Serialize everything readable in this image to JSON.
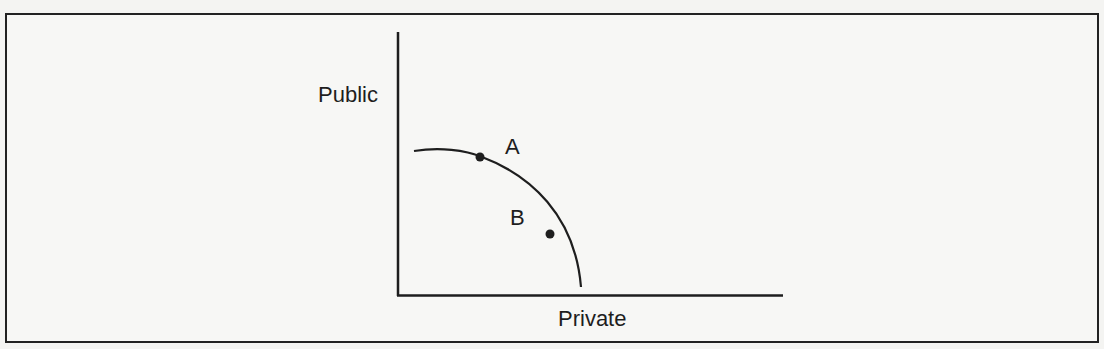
{
  "diagram": {
    "type": "production-possibilities-frontier",
    "y_axis_label": "Public",
    "x_axis_label": "Private",
    "points": [
      {
        "label": "A",
        "position": "on-curve"
      },
      {
        "label": "B",
        "position": "inside-curve"
      }
    ],
    "colors": {
      "ink": "#1e1e1e",
      "paper": "#f7f7f5",
      "frame": "#222222"
    }
  }
}
